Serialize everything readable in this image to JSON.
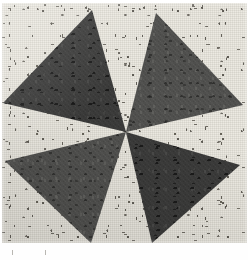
{
  "image": {
    "subject": "quilt-block-pinwheel",
    "description": "Photograph of a pieced fabric quilt block: four large triangles arranged as a pinwheel radiating from the center, set against a cream calico background printed with small dark floral sprigs.",
    "width_px": 248,
    "height_px": 260
  },
  "canvas": {
    "background_color": "#ffffff",
    "block": {
      "left_px": 2,
      "top_px": 3,
      "width_px": 245,
      "height_px": 240
    }
  },
  "background_fabric": {
    "name": "cream-floral-calico",
    "base_color": "#eceae2",
    "motif": "small-floral-sprig",
    "motif_color": "#65625b"
  },
  "pinwheel": {
    "center_x_px": 126,
    "center_y_px": 132,
    "triangle_count": 4,
    "triangles": [
      {
        "id": "triangle-top-left",
        "position": "top-left",
        "fabric": "dark-charcoal-mottled",
        "fill_color": "#3a3a39",
        "points": "3,103 92,10 126,132"
      },
      {
        "id": "triangle-top-right",
        "position": "top-right",
        "fabric": "medium-slate-mottled",
        "fill_color": "#4f4f4d",
        "points": "156,13 243,105 126,132"
      },
      {
        "id": "triangle-bottom-left",
        "position": "bottom-left",
        "fabric": "medium-slate-mottled",
        "fill_color": "#4f4f4d",
        "points": "5,161 91,243 126,132"
      },
      {
        "id": "triangle-bottom-right",
        "position": "bottom-right",
        "fabric": "dark-charcoal-mottled",
        "fill_color": "#3a3a39",
        "points": "240,165 152,243 126,132"
      }
    ]
  },
  "fabrics": {
    "dark": {
      "label": "dark-charcoal-mottled",
      "color": "#3a3a39"
    },
    "medium": {
      "label": "medium-slate-mottled",
      "color": "#4f4f4d"
    }
  },
  "margins": {
    "bottom_strip": {
      "label": "white-bottom-margin",
      "color": "#fefefe",
      "height_px": 17
    },
    "pencil_ticks": [
      {
        "x_px": 12,
        "y_px": 250
      },
      {
        "x_px": 45,
        "y_px": 250
      }
    ]
  }
}
